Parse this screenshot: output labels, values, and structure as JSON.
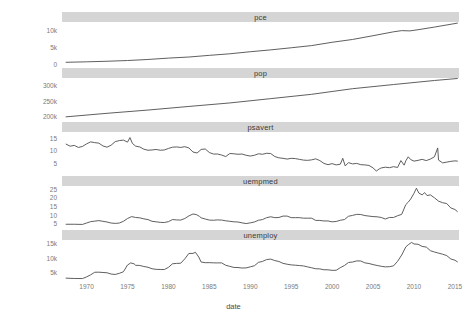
{
  "chart_data": {
    "type": "line",
    "title": "",
    "xlabel": "date",
    "ylabel": "",
    "grid": false,
    "legend": false,
    "facet": "variable",
    "facet_scales": "free_y",
    "xlim": [
      1967,
      2015.5
    ],
    "x_ticks": [
      "1970",
      "1975",
      "1980",
      "1985",
      "1990",
      "1995",
      "2000",
      "2005",
      "2010",
      "2015"
    ],
    "x_tick_values": [
      1970,
      1975,
      1980,
      1985,
      1990,
      1995,
      2000,
      2005,
      2010,
      2015
    ],
    "panels": [
      {
        "name": "pce",
        "label": "pce",
        "ylim": [
          0,
          12500
        ],
        "y_ticks": [
          "0",
          "5k",
          "10k"
        ],
        "y_tick_values": [
          0,
          5000,
          10000
        ],
        "x": [
          1967.5,
          1970,
          1972.5,
          1975,
          1977.5,
          1980,
          1982.5,
          1985,
          1987.5,
          1990,
          1992.5,
          1995,
          1997.5,
          2000,
          2002.5,
          2005,
          2007.5,
          2008.5,
          2009.5,
          2010.5,
          2012.5,
          2015.3
        ],
        "values": [
          507,
          648,
          815,
          1035,
          1348,
          1756,
          2076,
          2572,
          3038,
          3652,
          4203,
          4830,
          5480,
          6460,
          7305,
          8421,
          9581,
          9930,
          9851,
          10200,
          10990,
          12161
        ]
      },
      {
        "name": "pop",
        "label": "pop",
        "ylim": [
          195000,
          322000
        ],
        "y_ticks": [
          "200k",
          "250k",
          "300k"
        ],
        "y_tick_values": [
          200000,
          250000,
          300000
        ],
        "x": [
          1967.5,
          1972.5,
          1977.5,
          1982.5,
          1987.5,
          1992.5,
          1997.5,
          2002.5,
          2007.5,
          2012.5,
          2015.3
        ],
        "values": [
          198712,
          209896,
          220239,
          231664,
          242804,
          256514,
          270248,
          288028,
          301231,
          314087,
          320402
        ]
      },
      {
        "name": "psavert",
        "label": "psavert",
        "ylim": [
          1.5,
          17.3
        ],
        "y_ticks": [
          "5",
          "10",
          "15"
        ],
        "y_tick_values": [
          5,
          10,
          15
        ],
        "x": [
          1967.5,
          1968,
          1968.5,
          1969,
          1969.5,
          1970,
          1970.5,
          1971,
          1971.5,
          1972,
          1972.5,
          1973,
          1973.5,
          1974,
          1974.5,
          1975,
          1975.3,
          1975.6,
          1976,
          1976.5,
          1977,
          1977.5,
          1978,
          1978.5,
          1979,
          1979.5,
          1980,
          1980.5,
          1981,
          1981.5,
          1982,
          1982.5,
          1983,
          1983.5,
          1984,
          1984.5,
          1985,
          1985.5,
          1986,
          1986.5,
          1987,
          1987.5,
          1988,
          1988.5,
          1989,
          1989.5,
          1990,
          1990.5,
          1991,
          1991.5,
          1992,
          1992.5,
          1993,
          1993.5,
          1994,
          1994.5,
          1995,
          1995.5,
          1996,
          1996.5,
          1997,
          1997.5,
          1998,
          1998.5,
          1999,
          1999.5,
          2000,
          2000.5,
          2001,
          2001.3,
          2001.6,
          2002,
          2002.5,
          2003,
          2003.5,
          2004,
          2004.5,
          2005,
          2005.4,
          2005.8,
          2006,
          2006.5,
          2007,
          2007.5,
          2008,
          2008.4,
          2008.8,
          2009,
          2009.3,
          2009.6,
          2010,
          2010.5,
          2011,
          2011.5,
          2012,
          2012.5,
          2012.9,
          2013,
          2013.5,
          2014,
          2014.5,
          2015,
          2015.3
        ],
        "values": [
          12.5,
          11.7,
          12.0,
          11.2,
          11.6,
          12.6,
          13.4,
          13.1,
          12.9,
          11.8,
          11.3,
          12.1,
          13.5,
          13.9,
          14.1,
          13.3,
          15.1,
          12.8,
          11.7,
          11.4,
          10.5,
          10.1,
          10.2,
          10.4,
          10.1,
          10.2,
          10.8,
          11.3,
          11.4,
          11.2,
          11.5,
          11.0,
          9.4,
          9.0,
          10.4,
          10.6,
          9.2,
          8.6,
          8.6,
          8.2,
          7.6,
          8.8,
          8.7,
          8.5,
          8.6,
          8.1,
          7.8,
          8.1,
          8.7,
          8.5,
          8.9,
          8.8,
          7.6,
          7.1,
          6.9,
          6.6,
          6.9,
          6.8,
          6.5,
          6.2,
          6.1,
          6.3,
          6.7,
          6.0,
          4.9,
          4.4,
          4.8,
          4.3,
          4.6,
          6.9,
          3.9,
          5.2,
          4.7,
          4.9,
          4.4,
          4.3,
          4.1,
          3.1,
          1.9,
          2.8,
          3.1,
          3.4,
          3.2,
          3.6,
          3.3,
          6.0,
          4.2,
          5.9,
          7.5,
          6.4,
          5.8,
          6.1,
          6.5,
          6.0,
          6.6,
          7.5,
          11.0,
          6.2,
          5.1,
          5.4,
          5.7,
          5.9,
          5.8
        ]
      },
      {
        "name": "uempmed",
        "label": "uempmed",
        "ylim": [
          3.5,
          26.5
        ],
        "y_ticks": [
          "5",
          "10",
          "15",
          "20",
          "25"
        ],
        "y_tick_values": [
          5,
          10,
          15,
          20,
          25
        ],
        "x": [
          1967.5,
          1968.5,
          1969.5,
          1970,
          1970.5,
          1971,
          1971.5,
          1972,
          1972.5,
          1973,
          1973.5,
          1974,
          1974.5,
          1975,
          1975.5,
          1976,
          1976.5,
          1977,
          1977.5,
          1978,
          1978.5,
          1979,
          1979.5,
          1980,
          1980.5,
          1981,
          1981.5,
          1982,
          1982.5,
          1983,
          1983.4,
          1983.8,
          1984,
          1984.5,
          1985,
          1985.5,
          1986,
          1986.5,
          1987,
          1987.5,
          1988,
          1988.5,
          1989,
          1989.5,
          1990,
          1990.5,
          1991,
          1991.5,
          1992,
          1992.5,
          1993,
          1993.5,
          1994,
          1994.5,
          1995,
          1995.5,
          1996,
          1996.5,
          1997,
          1997.5,
          1998,
          1998.5,
          1999,
          1999.5,
          2000,
          2000.5,
          2001,
          2001.5,
          2002,
          2002.5,
          2003,
          2003.5,
          2004,
          2004.5,
          2005,
          2005.5,
          2006,
          2006.5,
          2007,
          2007.5,
          2008,
          2008.5,
          2009,
          2009.3,
          2009.6,
          2010,
          2010.3,
          2010.6,
          2011,
          2011.3,
          2011.6,
          2012,
          2012.5,
          2013,
          2013.5,
          2014,
          2014.5,
          2015,
          2015.3
        ],
        "values": [
          4.5,
          4.5,
          4.4,
          5.2,
          6.0,
          6.3,
          6.6,
          6.2,
          5.8,
          5.2,
          5.0,
          5.2,
          6.2,
          7.8,
          8.9,
          8.4,
          8.2,
          7.6,
          7.2,
          6.2,
          5.9,
          5.6,
          5.5,
          6.0,
          7.2,
          7.0,
          6.9,
          7.8,
          9.3,
          10.4,
          10.1,
          9.0,
          8.2,
          7.5,
          6.9,
          6.8,
          7.0,
          6.9,
          6.5,
          6.2,
          5.9,
          5.8,
          5.3,
          4.9,
          5.3,
          5.8,
          6.8,
          7.2,
          8.3,
          8.8,
          8.3,
          8.4,
          9.2,
          9.2,
          8.3,
          8.3,
          8.3,
          8.0,
          8.0,
          8.0,
          6.7,
          6.7,
          6.4,
          6.4,
          5.9,
          6.1,
          6.8,
          7.2,
          9.1,
          9.6,
          10.2,
          10.1,
          9.5,
          9.2,
          8.9,
          8.8,
          8.4,
          7.5,
          8.4,
          8.4,
          9.4,
          10.2,
          15.8,
          17.2,
          19.0,
          22.3,
          25.2,
          22.4,
          21.4,
          22.7,
          21.0,
          21.4,
          19.7,
          17.8,
          16.9,
          16.4,
          13.9,
          13.0,
          11.8,
          11.4
        ]
      },
      {
        "name": "unemploy",
        "label": "unemploy",
        "ylim": [
          2300,
          16200
        ],
        "y_ticks": [
          "5k",
          "10k",
          "15k"
        ],
        "y_tick_values": [
          5000,
          10000,
          15000
        ],
        "x": [
          1967.5,
          1968.5,
          1969.5,
          1970,
          1970.5,
          1971,
          1971.5,
          1972,
          1972.5,
          1973,
          1973.5,
          1974,
          1974.5,
          1975,
          1975.4,
          1975.8,
          1976,
          1976.5,
          1977,
          1977.5,
          1978,
          1978.5,
          1979,
          1979.5,
          1980,
          1980.5,
          1981,
          1981.5,
          1982,
          1982.5,
          1983,
          1983.3,
          1983.7,
          1984,
          1984.5,
          1985,
          1985.5,
          1986,
          1986.5,
          1987,
          1987.5,
          1988,
          1988.5,
          1989,
          1989.5,
          1990,
          1990.5,
          1991,
          1991.5,
          1992,
          1992.5,
          1993,
          1993.5,
          1994,
          1994.5,
          1995,
          1995.5,
          1996,
          1996.5,
          1997,
          1997.5,
          1998,
          1998.5,
          1999,
          1999.5,
          2000,
          2000.5,
          2001,
          2001.5,
          2002,
          2002.5,
          2003,
          2003.5,
          2004,
          2004.5,
          2005,
          2005.5,
          2006,
          2006.5,
          2007,
          2007.5,
          2008,
          2008.5,
          2009,
          2009.3,
          2009.7,
          2010,
          2010.5,
          2011,
          2011.5,
          2012,
          2012.5,
          2013,
          2013.5,
          2014,
          2014.5,
          2015,
          2015.3
        ],
        "values": [
          2944,
          2832,
          2800,
          3366,
          4093,
          4988,
          5016,
          4910,
          4810,
          4365,
          4231,
          4618,
          5156,
          7501,
          8237,
          7930,
          7406,
          7351,
          6991,
          6729,
          6210,
          5999,
          5963,
          5941,
          6683,
          7940,
          8070,
          8121,
          9643,
          11534,
          11534,
          11930,
          10300,
          8539,
          8312,
          8330,
          8264,
          8243,
          8251,
          7425,
          7037,
          6667,
          6629,
          6456,
          6508,
          6874,
          7239,
          8426,
          8759,
          9407,
          9564,
          9046,
          8730,
          8085,
          7781,
          7549,
          7442,
          7318,
          7184,
          6861,
          6543,
          6204,
          6155,
          5853,
          5843,
          5653,
          5679,
          6590,
          7330,
          8387,
          8548,
          8940,
          8904,
          8261,
          8037,
          7655,
          7344,
          7065,
          6856,
          6927,
          7202,
          8801,
          10979,
          13792,
          14546,
          15352,
          14825,
          14717,
          13956,
          13747,
          12500,
          12026,
          11635,
          11266,
          10772,
          9617,
          9172,
          8610,
          8407
        ]
      }
    ]
  }
}
